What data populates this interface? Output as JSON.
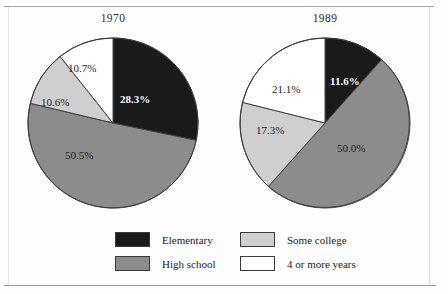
{
  "figure": {
    "charts": [
      {
        "title": "1970",
        "labels": [
          "28.3%",
          "50.5%",
          "10.6%",
          "10.7%"
        ]
      },
      {
        "title": "1989",
        "labels": [
          "11.6%",
          "50.0%",
          "17.3%",
          "21.1%"
        ]
      }
    ]
  },
  "legend": {
    "items": [
      {
        "label": "Elementary",
        "color": "#1a1a1a"
      },
      {
        "label": "High school",
        "color": "#8c8c8c"
      },
      {
        "label": "Some college",
        "color": "#cfcfcf"
      },
      {
        "label": "4 or more years",
        "color": "#ffffff"
      }
    ]
  },
  "chart_data": {
    "type": "pie",
    "title": "",
    "legend_position": "bottom",
    "categories": [
      "Elementary",
      "High school",
      "Some college",
      "4 or more years"
    ],
    "colors": [
      "#1a1a1a",
      "#8c8c8c",
      "#cfcfcf",
      "#ffffff"
    ],
    "charts": [
      {
        "title": "1970",
        "values": [
          28.3,
          50.5,
          10.6,
          10.7
        ],
        "labels": [
          "28.3%",
          "50.5%",
          "10.6%",
          "10.7%"
        ],
        "start_angle": 0,
        "direction": "clockwise"
      },
      {
        "title": "1989",
        "values": [
          11.6,
          50.0,
          17.3,
          21.1
        ],
        "labels": [
          "11.6%",
          "50.0%",
          "17.3%",
          "21.1%"
        ],
        "start_angle": 0,
        "direction": "clockwise"
      }
    ]
  }
}
